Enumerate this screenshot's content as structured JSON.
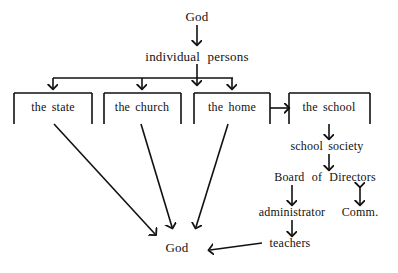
{
  "diagram": {
    "background_color": "#ffffff",
    "stroke_color": "#111111",
    "nodes": {
      "god_top": "God",
      "individual_persons": "individual  persons",
      "the_state": "the state",
      "the_church": "the church",
      "the_home": "the home",
      "the_school": "the school",
      "school_society": "school society",
      "board_of_directors": "Board  of  Directors",
      "administrator": "administrator",
      "comm": "Comm.",
      "teachers": "teachers",
      "god_bottom": "God"
    },
    "edges": [
      {
        "from": "God",
        "to": "individual persons",
        "kind": "arrow-down"
      },
      {
        "from": "individual persons",
        "to": "the state",
        "kind": "arrow-down-branch"
      },
      {
        "from": "individual persons",
        "to": "the church",
        "kind": "arrow-down-branch"
      },
      {
        "from": "individual persons",
        "to": "the home",
        "kind": "arrow-down-branch"
      },
      {
        "from": "the home",
        "to": "the school",
        "kind": "arrow-right"
      },
      {
        "from": "the school",
        "to": "school society",
        "kind": "arrow-down"
      },
      {
        "from": "school society",
        "to": "Board of Directors",
        "kind": "arrow-down"
      },
      {
        "from": "Board of Directors",
        "to": "administrator",
        "kind": "arrow-down"
      },
      {
        "from": "Board of Directors",
        "to": "Comm.",
        "kind": "arrow-double-vertical"
      },
      {
        "from": "administrator",
        "to": "teachers",
        "kind": "arrow-down"
      },
      {
        "from": "teachers",
        "to": "God",
        "kind": "arrow-left"
      },
      {
        "from": "the state",
        "to": "God",
        "kind": "arrow-diagonal"
      },
      {
        "from": "the church",
        "to": "God",
        "kind": "arrow-diagonal"
      },
      {
        "from": "the home",
        "to": "God",
        "kind": "arrow-diagonal"
      }
    ]
  }
}
